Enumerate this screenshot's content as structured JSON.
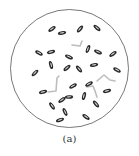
{
  "figure": {
    "caption": "(a)",
    "field": {
      "cx": 69.5,
      "cy": 68.5,
      "r": 59,
      "stroke": "#555555"
    },
    "colors": {
      "rod_fill": "#2a2a2a",
      "rod_highlight": "#ffffff",
      "filament": "#bdbdbd"
    },
    "rods": [
      {
        "x": 52,
        "y": 29,
        "a": -35
      },
      {
        "x": 62,
        "y": 33,
        "a": -10
      },
      {
        "x": 80,
        "y": 29,
        "a": -50
      },
      {
        "x": 97,
        "y": 28,
        "a": 40
      },
      {
        "x": 39,
        "y": 53,
        "a": 30
      },
      {
        "x": 51,
        "y": 52,
        "a": -15
      },
      {
        "x": 88,
        "y": 49,
        "a": -70
      },
      {
        "x": 98,
        "y": 52,
        "a": 25
      },
      {
        "x": 113,
        "y": 54,
        "a": -35
      },
      {
        "x": 51,
        "y": 65,
        "a": 75
      },
      {
        "x": 69,
        "y": 57,
        "a": 25
      },
      {
        "x": 67,
        "y": 68,
        "a": -40
      },
      {
        "x": 79,
        "y": 69,
        "a": 50
      },
      {
        "x": 94,
        "y": 65,
        "a": -10
      },
      {
        "x": 35,
        "y": 73,
        "a": -45
      },
      {
        "x": 117,
        "y": 70,
        "a": 30
      },
      {
        "x": 43,
        "y": 92,
        "a": -15
      },
      {
        "x": 73,
        "y": 86,
        "a": -30
      },
      {
        "x": 89,
        "y": 84,
        "a": -30
      },
      {
        "x": 107,
        "y": 91,
        "a": -15
      },
      {
        "x": 62,
        "y": 100,
        "a": -35
      },
      {
        "x": 69,
        "y": 97,
        "a": -5
      },
      {
        "x": 84,
        "y": 96,
        "a": -75
      },
      {
        "x": 52,
        "y": 106,
        "a": 55
      },
      {
        "x": 96,
        "y": 104,
        "a": 50
      },
      {
        "x": 65,
        "y": 112,
        "a": 65
      },
      {
        "x": 60,
        "y": 120,
        "a": -20
      },
      {
        "x": 86,
        "y": 117,
        "a": 35
      }
    ],
    "filaments": [
      "M72,45 L80,46 L82,41",
      "M48,92 L56,91 L57,78 L59,76",
      "M97,81 L104,75 L110,80 L115,81",
      "M87,87 L93,86 L95,91 L97,97"
    ]
  }
}
